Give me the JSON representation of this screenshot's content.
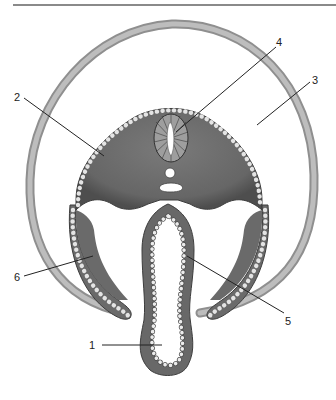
{
  "figure": {
    "type": "embryo-cross-section",
    "labels": [
      {
        "id": "1",
        "text": "1",
        "x": 94,
        "y": 347,
        "target": [
          131,
          345
        ]
      },
      {
        "id": "2",
        "text": "2",
        "x": 16,
        "y": 101,
        "target": [
          104,
          156
        ]
      },
      {
        "id": "3",
        "text": "3",
        "x": 316,
        "y": 82,
        "target": [
          257,
          125
        ]
      },
      {
        "id": "4",
        "text": "4",
        "x": 277,
        "y": 44,
        "target": [
          176,
          132
        ]
      },
      {
        "id": "5",
        "text": "5",
        "x": 285,
        "y": 320,
        "target": [
          187,
          256
        ]
      },
      {
        "id": "6",
        "text": "6",
        "x": 18,
        "y": 277,
        "target": [
          93,
          256
        ]
      }
    ],
    "colors": {
      "amnion": "#a8a8a8",
      "body": "#6e6e6e",
      "body_dark": "#555555",
      "cells": "#e8e8e8",
      "cavity": "#ffffff",
      "leader": "#222222"
    }
  }
}
